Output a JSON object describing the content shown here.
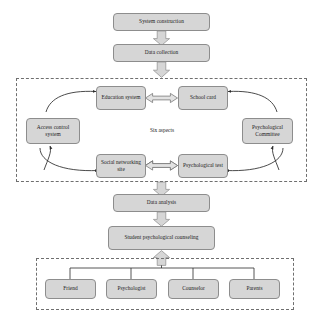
{
  "diagram": {
    "fill_color": "#d6d6d6",
    "border_color": "#8d8d8d",
    "line_color": "#2b2b2b",
    "group_border_color": "#6f6f6f",
    "background": "#ffffff"
  },
  "stages": {
    "system_construction": "System construction",
    "data_collection": "Data collection",
    "data_analysis": "Data analysis",
    "student_counseling": "Student psychological counseling"
  },
  "six_aspects": {
    "caption": "Six aspects",
    "nodes": [
      {
        "id": "education-system",
        "label": "Education system"
      },
      {
        "id": "school-card",
        "label": "School card"
      },
      {
        "id": "psychological-committee",
        "label": "Psychological Committee"
      },
      {
        "id": "psychological-test",
        "label": "Psychological test"
      },
      {
        "id": "social-networking-site",
        "label": "Social networking site"
      },
      {
        "id": "access-control-system",
        "label": "Access control system"
      }
    ]
  },
  "support_group": {
    "nodes": [
      {
        "id": "friend",
        "label": "Friend"
      },
      {
        "id": "psychologist",
        "label": "Psychologist"
      },
      {
        "id": "counselor",
        "label": "Counselor"
      },
      {
        "id": "parents",
        "label": "Parents"
      }
    ]
  },
  "connectors": {
    "block_arrow_down": "block-arrow-down",
    "block_arrow_up": "block-arrow-up",
    "double_headed_arrow": "double-headed-arrow",
    "curved_arrow": "curved-arrow"
  }
}
